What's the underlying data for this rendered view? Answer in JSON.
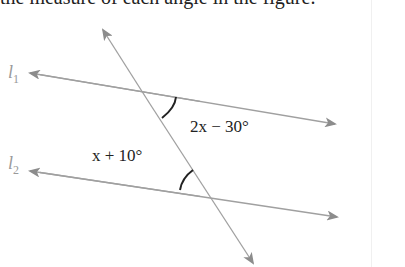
{
  "header": {
    "clipped_text": "the measure of each angle in the figure."
  },
  "diagram": {
    "lines": [
      {
        "id": "l1",
        "label": "l",
        "subscript": "1"
      },
      {
        "id": "l2",
        "label": "l",
        "subscript": "2"
      }
    ],
    "angles": [
      {
        "id": "angle-top",
        "expr": "2x − 30°"
      },
      {
        "id": "angle-bottom",
        "expr": "x + 10°"
      }
    ],
    "colors": {
      "line": "#a0a0a0",
      "arc": "#222222",
      "arrow": "#8c8c8c"
    }
  }
}
